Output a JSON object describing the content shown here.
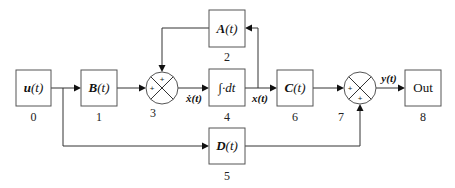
{
  "diagram": {
    "blocks": [
      {
        "id": "0",
        "label_main": "u",
        "label_arg": "(t)",
        "index": "0"
      },
      {
        "id": "1",
        "label_main": "B",
        "label_arg": "(t)",
        "index": "1"
      },
      {
        "id": "2",
        "label_main": "A",
        "label_arg": "(t)",
        "index": "2"
      },
      {
        "id": "4",
        "label_main": "∫·dt",
        "label_arg": "",
        "index": "4"
      },
      {
        "id": "5",
        "label_main": "D",
        "label_arg": "(t)",
        "index": "5"
      },
      {
        "id": "6",
        "label_main": "C",
        "label_arg": "(t)",
        "index": "6"
      },
      {
        "id": "8",
        "label_main": "Out",
        "label_arg": "",
        "index": "8"
      }
    ],
    "summing_junctions": [
      {
        "id": "3",
        "index": "3",
        "signs": [
          "+",
          "+"
        ]
      },
      {
        "id": "7",
        "index": "7",
        "signs": [
          "+",
          "+"
        ]
      }
    ],
    "signals": {
      "xdot": "ẋ(t)",
      "x": "x(t)",
      "y": "y(t)"
    },
    "colors": {
      "line": "#333333",
      "box_border": "#555555",
      "background": "#ffffff"
    }
  }
}
